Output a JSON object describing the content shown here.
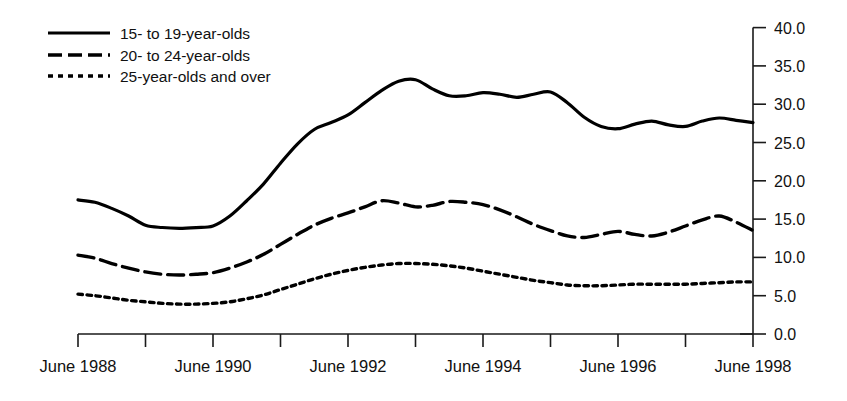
{
  "chart_data": {
    "type": "line",
    "title": "",
    "subtitle": "",
    "xlabel": "",
    "ylabel": "",
    "grid": false,
    "legend_position": "top-left",
    "xlim": [
      1988,
      1998
    ],
    "ylim": [
      0.0,
      40.0
    ],
    "y_ticks": [
      "40.0",
      "35.0",
      "30.0",
      "25.0",
      "20.0",
      "15.0",
      "10.0",
      "5.0",
      "0.0"
    ],
    "y_tick_values": [
      40.0,
      35.0,
      30.0,
      25.0,
      20.0,
      15.0,
      10.0,
      5.0,
      0.0
    ],
    "x_ticks": [
      "June 1988",
      "",
      "June 1990",
      "",
      "June 1992",
      "",
      "June 1994",
      "",
      "June 1996",
      "",
      "June 1998"
    ],
    "x_tick_values": [
      1988,
      1989,
      1990,
      1991,
      1992,
      1993,
      1994,
      1995,
      1996,
      1997,
      1998
    ],
    "x_labeled": [
      "June 1988",
      "June 1990",
      "June 1992",
      "June 1994",
      "June 1996",
      "June 1998"
    ],
    "x_labeled_values": [
      1988,
      1990,
      1992,
      1994,
      1996,
      1998
    ],
    "x": [
      1988.0,
      1988.25,
      1988.5,
      1988.75,
      1989.0,
      1989.25,
      1989.5,
      1989.75,
      1990.0,
      1990.25,
      1990.5,
      1990.75,
      1991.0,
      1991.25,
      1991.5,
      1991.75,
      1992.0,
      1992.25,
      1992.5,
      1992.75,
      1993.0,
      1993.25,
      1993.5,
      1993.75,
      1994.0,
      1994.25,
      1994.5,
      1994.75,
      1995.0,
      1995.25,
      1995.5,
      1995.75,
      1996.0,
      1996.25,
      1996.5,
      1996.75,
      1997.0,
      1997.25,
      1997.5,
      1997.75,
      1998.0
    ],
    "series": [
      {
        "name": "15- to 19-year-olds",
        "style": "solid",
        "values": [
          17.5,
          17.2,
          16.4,
          15.4,
          14.2,
          13.9,
          13.8,
          13.9,
          14.1,
          15.4,
          17.4,
          19.6,
          22.3,
          24.8,
          26.7,
          27.6,
          28.6,
          30.2,
          31.8,
          33.0,
          33.2,
          32.0,
          31.1,
          31.1,
          31.5,
          31.3,
          30.9,
          31.3,
          31.6,
          30.2,
          28.3,
          27.1,
          26.8,
          27.4,
          27.8,
          27.3,
          27.1,
          27.8,
          28.2,
          27.9,
          27.6
        ]
      },
      {
        "name": "20- to 24-year-olds",
        "style": "dashed",
        "values": [
          10.3,
          9.9,
          9.2,
          8.6,
          8.1,
          7.8,
          7.7,
          7.8,
          8.0,
          8.6,
          9.4,
          10.4,
          11.7,
          13.0,
          14.2,
          15.1,
          15.8,
          16.6,
          17.4,
          17.1,
          16.6,
          16.8,
          17.3,
          17.2,
          16.9,
          16.2,
          15.3,
          14.3,
          13.5,
          12.8,
          12.6,
          13.0,
          13.4,
          13.0,
          12.8,
          13.3,
          14.1,
          14.9,
          15.4,
          14.6,
          13.5
        ]
      },
      {
        "name": "25-year-olds and over",
        "style": "dotted",
        "values": [
          5.2,
          5.0,
          4.7,
          4.4,
          4.2,
          4.0,
          3.9,
          3.9,
          4.0,
          4.2,
          4.6,
          5.1,
          5.8,
          6.5,
          7.2,
          7.8,
          8.3,
          8.7,
          9.0,
          9.2,
          9.2,
          9.1,
          8.9,
          8.6,
          8.2,
          7.8,
          7.4,
          7.0,
          6.7,
          6.4,
          6.3,
          6.3,
          6.4,
          6.5,
          6.5,
          6.5,
          6.5,
          6.6,
          6.7,
          6.8,
          6.8
        ]
      }
    ]
  },
  "legend": {
    "items": [
      {
        "label": "15- to 19-year-olds",
        "style": "solid"
      },
      {
        "label": "20- to 24-year-olds",
        "style": "dashed"
      },
      {
        "label": "25-year-olds and over",
        "style": "dotted"
      }
    ]
  },
  "colors": {
    "ink": "#000000",
    "background": "#ffffff"
  }
}
